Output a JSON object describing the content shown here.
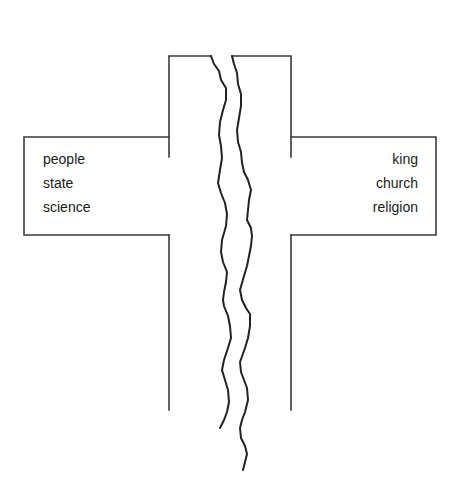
{
  "diagram": {
    "left_arm": {
      "labels": [
        "people",
        "state",
        "science"
      ]
    },
    "right_arm": {
      "labels": [
        "king",
        "church",
        "religion"
      ]
    },
    "colors": {
      "background": "#ffffff",
      "outline": "#3a3a3a",
      "crack": "#222222",
      "text": "#1a1a1a"
    }
  }
}
